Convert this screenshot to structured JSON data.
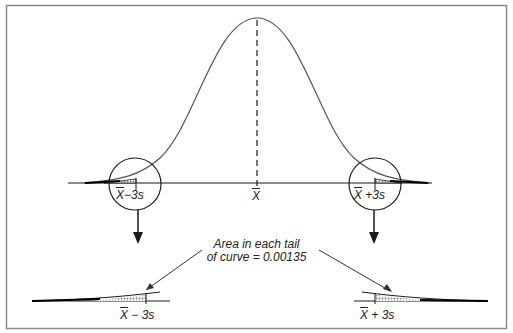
{
  "diagram": {
    "title": "",
    "mean_label": "X",
    "left_limit_label": {
      "bar": "X",
      "rest": " − 3s"
    },
    "right_limit_label": {
      "bar": "X",
      "rest": " + 3s"
    },
    "left_limit_upper": {
      "bar": "X",
      "rest": "−3s"
    },
    "right_limit_upper": {
      "bar": "X",
      "rest": " +3s"
    },
    "annotation_line1": "Area in each tail",
    "annotation_line2": "of curve = 0.00135",
    "tail_area": 0.00135,
    "colors": {
      "line": "#1a1a1a",
      "frame": "#8a8a8a",
      "curve": "#555555",
      "hatch": "#9a9a9a"
    }
  }
}
